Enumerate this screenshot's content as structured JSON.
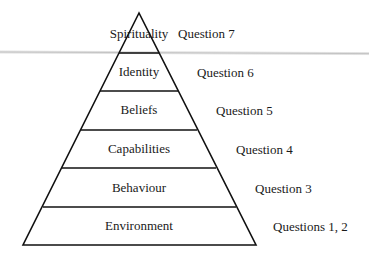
{
  "diagram": {
    "type": "pyramid",
    "layers": [
      {
        "label": "Spirituality",
        "question": "Question 7"
      },
      {
        "label": "Identity",
        "question": "Question 6"
      },
      {
        "label": "Beliefs",
        "question": "Question 5"
      },
      {
        "label": "Capabilities",
        "question": "Question 4"
      },
      {
        "label": "Behaviour",
        "question": "Question 3"
      },
      {
        "label": "Environment",
        "question": "Questions 1, 2"
      }
    ]
  },
  "colors": {
    "line": "#111111",
    "text": "#1a1a1a",
    "background": "#ffffff",
    "scan_band": "#b9b9b9"
  }
}
